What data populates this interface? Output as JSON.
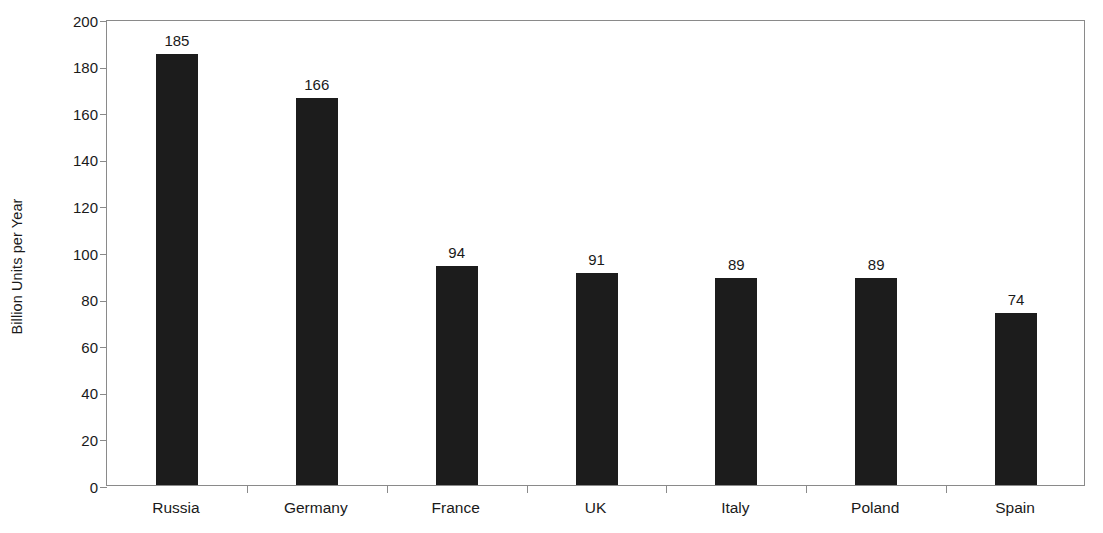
{
  "chart_data": {
    "type": "bar",
    "title": "",
    "xlabel": "",
    "ylabel": "Billion Units per Year",
    "categories": [
      "Russia",
      "Germany",
      "France",
      "UK",
      "Italy",
      "Poland",
      "Spain"
    ],
    "values": [
      185,
      166,
      94,
      91,
      89,
      89,
      74
    ],
    "value_labels": [
      "185",
      "166",
      "94",
      "91",
      "89",
      "89",
      "74"
    ],
    "ylim": [
      0,
      200
    ],
    "ytick_step": 20,
    "ytick_labels": [
      "0",
      "20",
      "40",
      "60",
      "80",
      "100",
      "120",
      "140",
      "160",
      "180",
      "200"
    ],
    "ytick_values": [
      0,
      20,
      40,
      60,
      80,
      100,
      120,
      140,
      160,
      180,
      200
    ],
    "grid": false,
    "legend": false,
    "legend_position": "none",
    "bar_color": "#1c1c1c",
    "axis_color": "#8a8a8a",
    "text_color": "#1a1a1a",
    "background_color": "#ffffff"
  }
}
